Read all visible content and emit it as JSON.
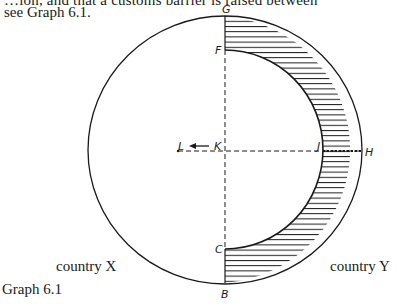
{
  "text": {
    "cut_line": "…ion, and that a customs barrier is raised between",
    "intro": "see Graph 6.1."
  },
  "diagram": {
    "points": {
      "G": "G",
      "F": "F",
      "K": "K",
      "L": "L",
      "J": "J",
      "H": "H",
      "C": "C",
      "B": "B"
    },
    "regions": {
      "left": "country X",
      "right": "country Y"
    },
    "caption": "Graph 6.1",
    "colors": {
      "ink": "#1a1a1a",
      "background": "#ffffff"
    }
  }
}
